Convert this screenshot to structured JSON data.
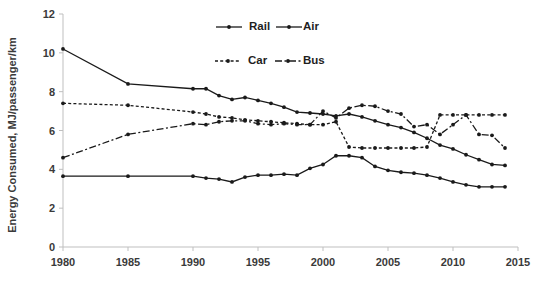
{
  "chart_data": {
    "type": "line",
    "title": "",
    "xlabel": "",
    "ylabel": "Energy Consumed, MJ/passenger/km",
    "xlim": [
      1980,
      2015
    ],
    "ylim": [
      0,
      12
    ],
    "ytick_labels": [
      "0",
      "2",
      "4",
      "6",
      "8",
      "10",
      "12"
    ],
    "yticks": [
      0,
      2,
      4,
      6,
      8,
      10,
      12
    ],
    "xtick_labels": [
      "1980",
      "1985",
      "1990",
      "1995",
      "2000",
      "2005",
      "2010",
      "2015"
    ],
    "xticks": [
      1980,
      1985,
      1990,
      1995,
      2000,
      2005,
      2010,
      2015
    ],
    "grid": false,
    "legend_position": "top-right",
    "x": [
      1980,
      1985,
      1990,
      1991,
      1992,
      1993,
      1994,
      1995,
      1996,
      1997,
      1998,
      1999,
      2000,
      2001,
      2002,
      2003,
      2004,
      2005,
      2006,
      2007,
      2008,
      2009,
      2010,
      2011,
      2012,
      2013,
      2014
    ],
    "series": [
      {
        "name": "Rail",
        "style": "solid",
        "marker": "circle",
        "values": [
          3.65,
          3.65,
          3.65,
          3.55,
          3.5,
          3.35,
          3.6,
          3.7,
          3.7,
          3.75,
          3.7,
          4.05,
          4.25,
          4.7,
          4.7,
          4.6,
          4.15,
          3.95,
          3.85,
          3.8,
          3.7,
          3.55,
          3.35,
          3.2,
          3.1,
          3.1,
          3.1
        ]
      },
      {
        "name": "Air",
        "style": "solid",
        "marker": "circle",
        "values": [
          10.2,
          8.4,
          8.15,
          8.15,
          7.8,
          7.6,
          7.7,
          7.55,
          7.4,
          7.2,
          6.95,
          6.9,
          6.85,
          6.75,
          6.85,
          6.7,
          6.5,
          6.3,
          6.15,
          5.9,
          5.6,
          5.25,
          5.05,
          4.75,
          4.5,
          4.25,
          4.2
        ]
      },
      {
        "name": "Car",
        "style": "dotted",
        "marker": "circle",
        "values": [
          7.4,
          7.3,
          6.95,
          6.85,
          6.7,
          6.65,
          6.55,
          6.5,
          6.45,
          6.4,
          6.35,
          6.3,
          6.3,
          6.45,
          5.15,
          5.1,
          5.1,
          5.1,
          5.1,
          5.1,
          5.15,
          6.8,
          6.8,
          6.8,
          6.8,
          6.8,
          6.8
        ]
      },
      {
        "name": "Bus",
        "style": "dashdot",
        "marker": "circle",
        "values": [
          4.6,
          5.8,
          6.35,
          6.3,
          6.45,
          6.5,
          6.5,
          6.35,
          6.3,
          6.35,
          6.3,
          6.3,
          7.0,
          6.65,
          7.15,
          7.3,
          7.25,
          7.0,
          6.85,
          6.2,
          6.3,
          5.8,
          6.3,
          6.8,
          5.8,
          5.75,
          5.1
        ]
      }
    ]
  },
  "legend": {
    "items": [
      {
        "label": "Rail"
      },
      {
        "label": "Air"
      },
      {
        "label": "Car"
      },
      {
        "label": "Bus"
      }
    ]
  },
  "footnote": ""
}
